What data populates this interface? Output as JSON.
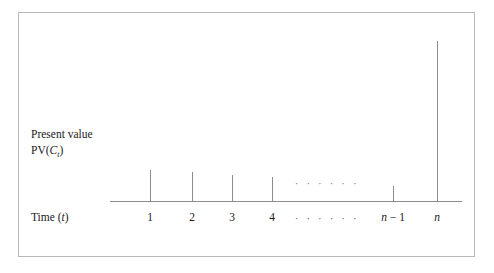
{
  "figure": {
    "background_color": "#ffffff",
    "line_color": "#8d8d8d",
    "text_color": "#1a1a1a",
    "border_color": "#b9b9b9"
  },
  "labels": {
    "y_axis_line1": "Present value",
    "y_axis_line2_prefix": "PV(",
    "y_axis_line2_var": "C",
    "y_axis_line2_sub": "t",
    "y_axis_line2_suffix": ")",
    "x_axis_prefix": "Time (",
    "x_axis_var": "t",
    "x_axis_suffix": ")"
  },
  "chart_data": {
    "type": "bar",
    "title": "",
    "xlabel": "Time (t)",
    "ylabel": "Present value PV(C_t)",
    "grid": false,
    "legend": null,
    "categories": [
      "1",
      "2",
      "3",
      "4",
      "......",
      "n − 1",
      "n"
    ],
    "values": [
      31,
      29,
      26,
      24,
      null,
      15,
      160
    ],
    "ellipsis_marker": "· · · · · ·",
    "bars": [
      {
        "label": "1",
        "x_px": 150,
        "top_px": 170,
        "height_px": 31,
        "italic_label": false
      },
      {
        "label": "2",
        "x_px": 192,
        "top_px": 172,
        "height_px": 29,
        "italic_label": false
      },
      {
        "label": "3",
        "x_px": 232,
        "top_px": 175,
        "height_px": 26,
        "italic_label": false
      },
      {
        "label": "4",
        "x_px": 272,
        "top_px": 177,
        "height_px": 24,
        "italic_label": false
      },
      {
        "label": "n − 1",
        "x_px": 393,
        "top_px": 186,
        "height_px": 15,
        "italic_label": true
      },
      {
        "label": "n",
        "x_px": 437,
        "top_px": 41,
        "height_px": 160,
        "italic_label": true
      }
    ],
    "axis": {
      "baseline_y_px": 201,
      "x_start_px": 110,
      "x_end_px": 462
    },
    "plot_ellipsis": {
      "x_px": 327,
      "y_px": 178
    },
    "axis_ellipsis": {
      "x_px": 327
    }
  }
}
